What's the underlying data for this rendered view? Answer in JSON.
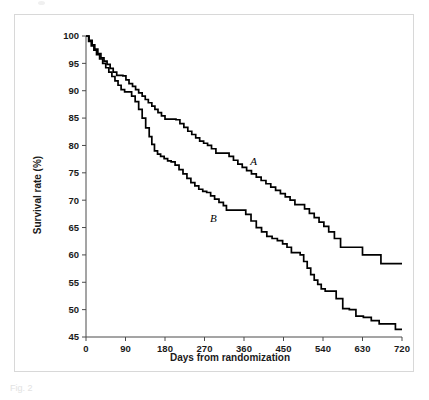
{
  "figure": {
    "caption_fragment": "Fig. 2",
    "frame_border_color": "#d8d8d8",
    "background_color": "#ffffff"
  },
  "chart_data": {
    "type": "line",
    "title": "",
    "xlabel": "Days from randomization",
    "ylabel": "Survival rate (%)",
    "xlim": [
      0,
      720
    ],
    "ylim": [
      45,
      100
    ],
    "xticks": [
      0,
      90,
      180,
      270,
      360,
      450,
      540,
      630,
      720
    ],
    "xticklabels": [
      "0",
      "90",
      "180",
      "270",
      "360",
      "450",
      "540",
      "630",
      "720"
    ],
    "yticks": [
      45,
      50,
      55,
      60,
      65,
      70,
      75,
      80,
      85,
      90,
      95,
      100
    ],
    "yticklabels": [
      "45",
      "50",
      "55",
      "60",
      "65",
      "70",
      "75",
      "80",
      "85",
      "90",
      "95",
      "100"
    ],
    "grid": false,
    "legend": "inline-labels",
    "step_style": "post",
    "line_color": "#000000",
    "annotations": [
      {
        "text": "A",
        "x": 382,
        "y": 76.5,
        "series": "A"
      },
      {
        "text": "B",
        "x": 290,
        "y": 66.0,
        "series": "B"
      }
    ],
    "series": [
      {
        "name": "A",
        "label": "A",
        "final_value": 58.4,
        "x": [
          0,
          7,
          14,
          20,
          27,
          34,
          41,
          48,
          55,
          62,
          70,
          77,
          84,
          91,
          98,
          106,
          113,
          120,
          128,
          135,
          142,
          150,
          157,
          164,
          172,
          180,
          188,
          196,
          205,
          214,
          223,
          232,
          241,
          250,
          259,
          268,
          277,
          286,
          296,
          306,
          316,
          326,
          336,
          346,
          356,
          366,
          377,
          388,
          399,
          410,
          421,
          432,
          443,
          454,
          465,
          476,
          487,
          498,
          509,
          520,
          531,
          542,
          553,
          566,
          580,
          595,
          612,
          630,
          650,
          672,
          690,
          720
        ],
        "y": [
          100.0,
          99.2,
          98.4,
          97.6,
          96.8,
          96.0,
          95.4,
          94.8,
          94.1,
          93.4,
          92.8,
          92.8,
          92.7,
          92.0,
          91.3,
          90.8,
          90.2,
          89.6,
          89.0,
          88.4,
          87.8,
          87.2,
          86.6,
          86.0,
          85.4,
          84.8,
          84.8,
          84.8,
          84.7,
          84.0,
          83.3,
          82.6,
          82.0,
          81.4,
          80.8,
          80.4,
          80.0,
          79.4,
          78.6,
          78.6,
          78.6,
          78.0,
          77.3,
          76.6,
          76.0,
          75.4,
          74.8,
          74.2,
          73.6,
          73.0,
          72.4,
          71.8,
          71.2,
          70.6,
          70.0,
          69.2,
          69.2,
          68.4,
          67.6,
          66.8,
          66.0,
          65.2,
          64.2,
          63.0,
          61.4,
          61.4,
          61.4,
          60.0,
          60.0,
          58.4,
          58.4,
          58.4
        ]
      },
      {
        "name": "B",
        "label": "B",
        "final_value": 46.4,
        "x": [
          0,
          6,
          12,
          18,
          24,
          31,
          38,
          45,
          52,
          59,
          66,
          73,
          80,
          88,
          96,
          104,
          112,
          120,
          128,
          136,
          144,
          150,
          156,
          163,
          170,
          178,
          186,
          194,
          203,
          212,
          221,
          230,
          239,
          248,
          257,
          266,
          275,
          284,
          293,
          303,
          313,
          320,
          330,
          340,
          352,
          364,
          376,
          388,
          400,
          412,
          424,
          436,
          448,
          458,
          468,
          478,
          488,
          496,
          504,
          512,
          520,
          528,
          536,
          545,
          556,
          570,
          585,
          600,
          615,
          632,
          650,
          668,
          686,
          705,
          720
        ],
        "y": [
          100.0,
          99.0,
          98.2,
          97.4,
          96.6,
          95.8,
          95.0,
          94.2,
          93.4,
          92.6,
          91.8,
          91.0,
          90.2,
          89.8,
          89.8,
          89.0,
          88.0,
          86.6,
          85.0,
          83.2,
          81.6,
          80.2,
          79.0,
          78.4,
          78.0,
          77.6,
          77.2,
          77.0,
          76.4,
          75.6,
          74.8,
          74.0,
          73.2,
          72.6,
          72.0,
          71.6,
          71.4,
          70.8,
          70.2,
          69.6,
          69.0,
          68.2,
          68.2,
          68.2,
          68.2,
          67.4,
          66.2,
          65.0,
          64.2,
          63.4,
          63.0,
          62.6,
          62.0,
          61.4,
          60.4,
          60.4,
          60.0,
          58.8,
          57.6,
          56.4,
          55.4,
          54.6,
          53.8,
          53.4,
          53.4,
          52.0,
          50.2,
          50.0,
          48.8,
          48.6,
          48.0,
          47.4,
          47.4,
          46.4,
          46.4
        ]
      }
    ]
  }
}
